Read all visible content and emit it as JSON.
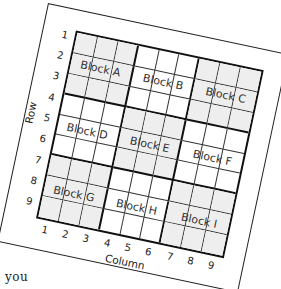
{
  "diagram": {
    "axis": {
      "row_label": "Row",
      "column_label": "Column"
    },
    "row_numbers": [
      "1",
      "2",
      "3",
      "4",
      "5",
      "6",
      "7",
      "8",
      "9"
    ],
    "column_numbers": [
      "1",
      "2",
      "3",
      "4",
      "5",
      "6",
      "7",
      "8",
      "9"
    ],
    "blocks": [
      {
        "label": "Block A",
        "shaded": true
      },
      {
        "label": "Block B",
        "shaded": false
      },
      {
        "label": "Block C",
        "shaded": true
      },
      {
        "label": "Block D",
        "shaded": false
      },
      {
        "label": "Block E",
        "shaded": true
      },
      {
        "label": "Block F",
        "shaded": false
      },
      {
        "label": "Block G",
        "shaded": true
      },
      {
        "label": "Block H",
        "shaded": false
      },
      {
        "label": "Block I",
        "shaded": true
      }
    ],
    "colors": {
      "shaded_block": "#eeeeee",
      "unshaded_block": "#ffffff",
      "lines": "#111111"
    },
    "rotation_degrees": 12
  },
  "footer_text": "you"
}
